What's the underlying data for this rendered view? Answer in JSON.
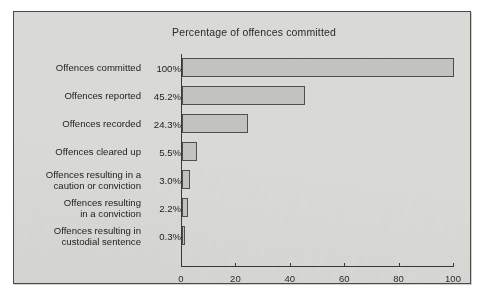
{
  "chart_data": {
    "type": "bar",
    "orientation": "horizontal",
    "title": "Percentage of offences committed",
    "xlabel": "",
    "ylabel": "",
    "xlim": [
      0,
      100
    ],
    "xticks": [
      0,
      20,
      40,
      60,
      80,
      100
    ],
    "xtick_labels": [
      "0",
      "20",
      "40",
      "60",
      "80",
      "100"
    ],
    "grid": false,
    "legend": "none",
    "categories": [
      "Offences committed",
      "Offences reported",
      "Offences recorded",
      "Offences cleared up",
      "Offences resulting in a caution or conviction",
      "Offences resulting in a conviction",
      "Offences resulting in custodial sentence"
    ],
    "category_lines": [
      [
        "Offences committed"
      ],
      [
        "Offences reported"
      ],
      [
        "Offences recorded"
      ],
      [
        "Offences cleared up"
      ],
      [
        "Offences resulting in a",
        "caution or conviction"
      ],
      [
        "Offences resulting",
        "in a conviction"
      ],
      [
        "Offences resulting in",
        "custodial sentence"
      ]
    ],
    "values": [
      100,
      45.2,
      24.3,
      5.5,
      3.0,
      2.2,
      0.3
    ],
    "value_labels": [
      "100%",
      "45.2%",
      "24.3%",
      "5.5%",
      "3.0%",
      "2.2%",
      "0.3%"
    ],
    "colors": {
      "bar_fill": "#c2c2c0",
      "bar_border": "#4e4e4e",
      "background": "#d9d9d6",
      "frame_border": "#4a4a4a",
      "text": "#232323",
      "axis": "#3a3a3a"
    }
  }
}
